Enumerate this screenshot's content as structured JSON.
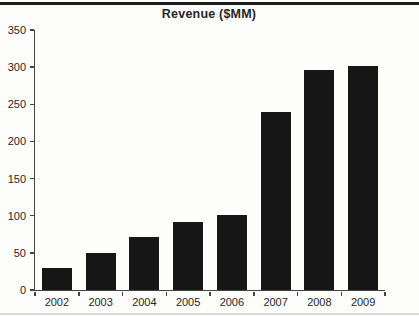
{
  "figure": {
    "title": "Revenue ($MM)"
  },
  "colors": {
    "background": "#fdfdfb",
    "bar": "#161616",
    "axis": "#444444",
    "text": "#262626",
    "top_rule": "#1a1a1a",
    "bottom_rule": "#d8d8d8"
  },
  "chart_data": {
    "type": "bar",
    "title": "Revenue ($MM)",
    "categories": [
      "2002",
      "2003",
      "2004",
      "2005",
      "2006",
      "2007",
      "2008",
      "2009"
    ],
    "values": [
      29,
      50,
      71,
      92,
      101,
      240,
      296,
      302
    ],
    "xlabel": "",
    "ylabel": "",
    "ylim": [
      0,
      350
    ],
    "ytick_step": 50,
    "ytick_labels": [
      "0",
      "50",
      "100",
      "150",
      "200",
      "250",
      "300",
      "350"
    ],
    "grid": false,
    "legend": null,
    "bar_width_px": 30,
    "plot_width_px": 350,
    "plot_height_px": 260
  }
}
